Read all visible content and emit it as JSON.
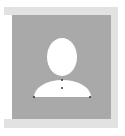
{
  "image": {
    "type": "avatar-placeholder",
    "description": "Generic user silhouette placeholder",
    "colors": {
      "background": "#ffffff",
      "frame": "#e2e2e2",
      "panel": "#a9a9a9",
      "silhouette": "#ffffff",
      "anchor_dots": "#333333"
    }
  }
}
